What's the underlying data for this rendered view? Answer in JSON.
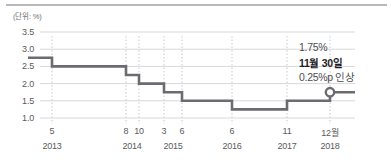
{
  "unit_label": "(단위: %)",
  "annotations": {
    "rate": "1.75%",
    "date": "11월 30일",
    "delta": "0.25%p 인상"
  },
  "colors": {
    "line": "#6b6b70",
    "grid": "#d8d8dc",
    "guide": "#c9c9cf",
    "text": "#5a5a5e",
    "bold_text": "#1d1d1f",
    "top_rule": "#b9b9bd",
    "marker_fill": "#ffffff"
  },
  "chart_data": {
    "type": "line",
    "title": "",
    "subtitle": "",
    "xlabel": "",
    "ylabel": "(단위: %)",
    "ylim": [
      1.0,
      3.5
    ],
    "yticks": [
      "3.5",
      "3.0",
      "2.5",
      "2.0",
      "1.5",
      "1.0"
    ],
    "ytick_values": [
      3.5,
      3.0,
      2.5,
      2.0,
      1.5,
      1.0
    ],
    "grid": true,
    "legend": "none",
    "line_style": "step",
    "x_month_labels": [
      "5",
      "8",
      "10",
      "3",
      "6",
      "6",
      "11",
      "12월"
    ],
    "x_year_labels": [
      "2013",
      "2014",
      "2015",
      "2016",
      "2017",
      "2018"
    ],
    "series": [
      {
        "name": "기준금리",
        "values": [
          2.75,
          2.5,
          2.25,
          2.0,
          1.75,
          1.5,
          1.25,
          1.5,
          1.75
        ],
        "x": [
          "2013-01",
          "2013-05",
          "2014-08",
          "2014-10",
          "2015-03",
          "2015-06",
          "2016-06",
          "2017-11",
          "2018-12"
        ]
      }
    ],
    "marker": {
      "x": "2018-12",
      "y": 1.75,
      "label": "1.75%"
    },
    "annotations": [
      {
        "text": "1.75%",
        "value": 1.75
      },
      {
        "text": "11월 30일",
        "value": null
      },
      {
        "text": "0.25%p 인상",
        "value": 0.25
      }
    ]
  }
}
